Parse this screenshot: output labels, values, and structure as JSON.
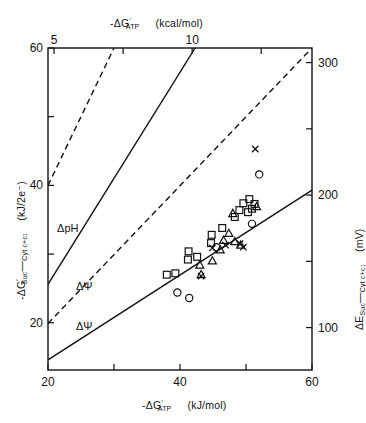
{
  "chart_data": {
    "type": "scatter",
    "title": "",
    "xlabel": "-ΔG'ATP (kJ/mol)",
    "ylabel": "-ΔG'Suc→Cyt c+c1 (kJ/2e-)",
    "top_axis_label": "-ΔG'ATP (kcal/mol)",
    "right_axis_label": "ΔE Suc→Cyt c+c1 (mV)",
    "xlim": [
      20,
      60
    ],
    "ylim": [
      13.125,
      60
    ],
    "top_xlim": [
      4.78,
      14.34
    ],
    "right_ylim": [
      68.0,
      311.0
    ],
    "xticks": [
      20,
      30,
      40,
      50,
      60
    ],
    "xticklabels": [
      "20",
      "",
      "40",
      "",
      "60"
    ],
    "yticks": [
      20,
      30,
      40,
      50,
      60
    ],
    "yticklabels": [
      "20",
      "",
      "40",
      "",
      "60"
    ],
    "top_ticks": [
      5,
      7.5,
      10,
      12.5
    ],
    "top_ticklabels": [
      "5",
      "",
      "10",
      ""
    ],
    "right_ticks": [
      100,
      150,
      200,
      250,
      300
    ],
    "right_ticklabels": [
      "100",
      "",
      "200",
      "",
      "300"
    ],
    "grid": false,
    "legend": "none",
    "series": [
      {
        "name": "squares",
        "marker": "square",
        "points": [
          [
            38.0,
            27.0
          ],
          [
            39.3,
            27.2
          ],
          [
            41.2,
            29.2
          ],
          [
            41.3,
            30.4
          ],
          [
            42.6,
            29.6
          ],
          [
            44.7,
            31.6
          ],
          [
            44.8,
            32.8
          ],
          [
            46.4,
            33.8
          ],
          [
            48.3,
            35.4
          ],
          [
            49.0,
            36.4
          ],
          [
            49.6,
            37.4
          ],
          [
            50.3,
            36.1
          ],
          [
            50.5,
            38.0
          ],
          [
            50.9,
            36.6
          ],
          [
            51.3,
            37.3
          ]
        ]
      },
      {
        "name": "triangles",
        "marker": "triangle",
        "points": [
          [
            43.0,
            28.4
          ],
          [
            43.2,
            27.0
          ],
          [
            44.9,
            29.0
          ],
          [
            46.1,
            30.6
          ],
          [
            46.6,
            32.0
          ],
          [
            47.4,
            33.0
          ],
          [
            48.0,
            35.9
          ],
          [
            48.3,
            31.8
          ],
          [
            49.2,
            31.3
          ],
          [
            51.6,
            36.9
          ]
        ]
      },
      {
        "name": "circles",
        "marker": "circle",
        "points": [
          [
            39.6,
            24.4
          ],
          [
            41.4,
            23.6
          ],
          [
            45.5,
            31.0
          ],
          [
            50.9,
            34.4
          ],
          [
            52.0,
            41.6
          ]
        ]
      },
      {
        "name": "crosses",
        "marker": "x",
        "points": [
          [
            43.2,
            26.8
          ],
          [
            44.9,
            30.9
          ],
          [
            46.9,
            31.3
          ],
          [
            49.1,
            31.5
          ],
          [
            49.6,
            31.0
          ],
          [
            51.4,
            45.3
          ]
        ]
      }
    ],
    "reference_lines": [
      {
        "label": "ΔpH",
        "style": "dashed",
        "x1": 20.0,
        "y1": 40.0,
        "x2": 30.0,
        "y2": 60.0
      },
      {
        "label": "ΔpH",
        "style": "solid",
        "x1": 20.0,
        "y1": 25.6,
        "x2": 42.3,
        "y2": 60.0
      },
      {
        "label": "ΔΨ",
        "style": "dashed",
        "x1": 20.0,
        "y1": 19.9,
        "x2": 60.0,
        "y2": 60.0
      },
      {
        "label": "ΔΨ",
        "style": "solid",
        "x1": 20.0,
        "y1": 14.6,
        "x2": 60.0,
        "y2": 39.3
      }
    ],
    "line_labels": [
      {
        "text": "ΔpH",
        "x": 7.5,
        "y": 51.2
      },
      {
        "text": "ΔpH",
        "x": 23.0,
        "y": 33.2
      },
      {
        "text": "ΔΨ",
        "x": 25.5,
        "y": 24.8
      },
      {
        "text": "ΔΨ",
        "x": 25.5,
        "y": 19.0
      }
    ]
  },
  "axes": {
    "bottom": {
      "title_main": "-ΔG",
      "title_prime": "′",
      "title_sub": "ATP",
      "title_units": "(kJ/mol)",
      "ticklabels": [
        "20",
        "40",
        "60"
      ]
    },
    "top": {
      "title_main": "-ΔG",
      "title_prime": "′",
      "title_sub": "ATP",
      "title_units": "(kcal/mol)",
      "ticklabel_left": "5",
      "ticklabel_mid": "10"
    },
    "left": {
      "title_main": "-ΔG",
      "title_prime": "′",
      "title_sub": "Suc",
      "title_arrow": "—",
      "title_sub2": "Cyt c+c",
      "title_sub3": "1",
      "title_units": "(kJ/2e⁻)",
      "ticklabels": [
        "20",
        "40",
        "60"
      ]
    },
    "right": {
      "title_main": "ΔE",
      "title_sub": "Suc",
      "title_arrow": "—",
      "title_sub2": "Cyt c+c",
      "title_sub3": "1",
      "title_units": "(mV)",
      "ticklabels": [
        "100",
        "200",
        "300"
      ]
    }
  },
  "style": {
    "line_color": "#111111",
    "marker_color": "#111111",
    "background": "#ffffff"
  }
}
